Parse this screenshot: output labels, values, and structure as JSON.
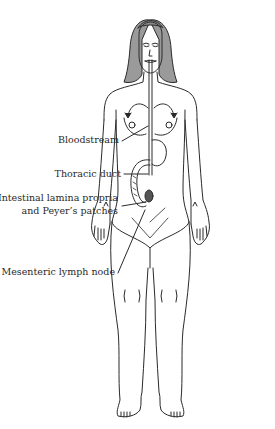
{
  "figure": {
    "labels": [
      {
        "id": "bloodstream",
        "text": "Bloodstream"
      },
      {
        "id": "thoracic_duct",
        "text": "Thoracic duct"
      },
      {
        "id": "intestinal_lamina_line1",
        "text": "Intestinal lamina propria"
      },
      {
        "id": "intestinal_lamina_line2",
        "text": "and Peyer’s patches"
      },
      {
        "id": "mesenteric",
        "text": "Mesenteric lymph node"
      }
    ],
    "colors": {
      "line": "#2a2a2a",
      "hair": "#8a8a8a",
      "background": "#ffffff"
    }
  }
}
